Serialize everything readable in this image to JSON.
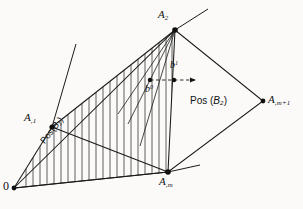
{
  "figure": {
    "type": "geometric-diagram",
    "background_color": "#fbfaf8",
    "line_color": "#1a1a1a",
    "hatch_color": "#2b2b2b"
  },
  "labels": {
    "origin": "0",
    "a2_base": "A",
    "a2_sub": "2",
    "a1_base": "A",
    "a1_sub": ",1",
    "am_base": "A",
    "am_sub": ",m",
    "amp1_base": "A",
    "amp1_sub": ",m+1",
    "b0_base": "b",
    "b0_sup": "0",
    "b1_base": "b",
    "b1_sup": "1",
    "pos_b1_text": "Pos(",
    "pos_b1_var": "B",
    "pos_b1_sub": "1",
    "pos_b1_close": ")",
    "pos_b2_text": "Pos (",
    "pos_b2_var": "B",
    "pos_b2_sub": "2",
    "pos_b2_close": ")"
  },
  "vertices": {
    "origin": {
      "x": 14,
      "y": 188
    },
    "a1": {
      "x": 52,
      "y": 127
    },
    "a2": {
      "x": 175,
      "y": 30
    },
    "am": {
      "x": 168,
      "y": 172
    },
    "amp1": {
      "x": 263,
      "y": 101
    },
    "b0": {
      "x": 150,
      "y": 80
    },
    "b1": {
      "x": 174,
      "y": 80
    },
    "arrow_tip": {
      "x": 199,
      "y": 80
    }
  }
}
